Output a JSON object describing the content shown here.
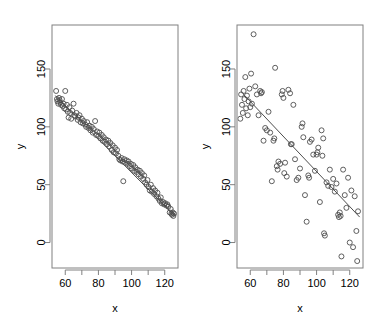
{
  "figure": {
    "type": "scatter-pair",
    "width": 370,
    "height": 332,
    "background": "#ffffff",
    "point_color": "#4d4d4d",
    "line_color": "#4d4d4d",
    "axis_color": "#808080"
  },
  "panels": [
    {
      "id": "left",
      "name": "strong-correlation-panel",
      "xlabel": "x",
      "ylabel": "y",
      "x_ticks": [
        60,
        70,
        80,
        90,
        100,
        110,
        120
      ],
      "x_tick_labels": [
        "60",
        "",
        "80",
        "",
        "100",
        "",
        "120"
      ],
      "y_ticks": [
        0,
        50,
        100,
        150
      ],
      "y_tick_labels": [
        "0",
        "50",
        "100",
        "150"
      ],
      "xlim": [
        52,
        128
      ],
      "ylim": [
        -22,
        188
      ]
    },
    {
      "id": "right",
      "name": "weak-correlation-panel",
      "xlabel": "x",
      "ylabel": "y",
      "x_ticks": [
        60,
        70,
        80,
        90,
        100,
        110,
        120
      ],
      "x_tick_labels": [
        "60",
        "",
        "80",
        "",
        "100",
        "",
        "120"
      ],
      "y_ticks": [
        0,
        50,
        100,
        150
      ],
      "y_tick_labels": [
        "0",
        "50",
        "100",
        "150"
      ],
      "xlim": [
        52,
        128
      ],
      "ylim": [
        -22,
        188
      ]
    }
  ],
  "chart_data": [
    {
      "type": "scatter",
      "title": "",
      "xlabel": "x",
      "ylabel": "y",
      "xlim": [
        52,
        128
      ],
      "ylim": [
        -22,
        188
      ],
      "grid": false,
      "legend": false,
      "marker": "open-circle",
      "regression_line": {
        "x": [
          54,
          126
        ],
        "y": [
          127,
          23
        ]
      },
      "points": [
        [
          54.5,
          131
        ],
        [
          55.0,
          124
        ],
        [
          55.3,
          122
        ],
        [
          55.8,
          120
        ],
        [
          56.2,
          125
        ],
        [
          56.6,
          123
        ],
        [
          57.0,
          121
        ],
        [
          57.5,
          119
        ],
        [
          58.0,
          124
        ],
        [
          58.5,
          118
        ],
        [
          59.0,
          120
        ],
        [
          59.4,
          116
        ],
        [
          60.0,
          131
        ],
        [
          60.5,
          115
        ],
        [
          61.0,
          119
        ],
        [
          61.5,
          113
        ],
        [
          62.0,
          108
        ],
        [
          62.5,
          117
        ],
        [
          63.0,
          112
        ],
        [
          63.6,
          107
        ],
        [
          64.2,
          114
        ],
        [
          65.0,
          120
        ],
        [
          65.5,
          110
        ],
        [
          66.0,
          109
        ],
        [
          66.8,
          112
        ],
        [
          67.5,
          106
        ],
        [
          68.0,
          108
        ],
        [
          68.6,
          110
        ],
        [
          69.2,
          104
        ],
        [
          70.0,
          107
        ],
        [
          70.6,
          103
        ],
        [
          71.2,
          105
        ],
        [
          72.0,
          102
        ],
        [
          72.6,
          100
        ],
        [
          73.2,
          104
        ],
        [
          74.0,
          99
        ],
        [
          74.6,
          101
        ],
        [
          75.2,
          97
        ],
        [
          76.0,
          100
        ],
        [
          76.6,
          95
        ],
        [
          77.2,
          98
        ],
        [
          78.0,
          105
        ],
        [
          78.6,
          93
        ],
        [
          79.2,
          96
        ],
        [
          80.0,
          92
        ],
        [
          80.6,
          95
        ],
        [
          81.2,
          90
        ],
        [
          82.0,
          93
        ],
        [
          82.6,
          88
        ],
        [
          83.2,
          91
        ],
        [
          84.0,
          87
        ],
        [
          84.6,
          89
        ],
        [
          85.2,
          85
        ],
        [
          86.0,
          88
        ],
        [
          86.6,
          83
        ],
        [
          87.2,
          86
        ],
        [
          88.0,
          80
        ],
        [
          88.6,
          84
        ],
        [
          89.2,
          78
        ],
        [
          90.0,
          82
        ],
        [
          90.6,
          77
        ],
        [
          91.2,
          80
        ],
        [
          92.0,
          75
        ],
        [
          92.6,
          72
        ],
        [
          93.2,
          71
        ],
        [
          94.0,
          73
        ],
        [
          94.6,
          70
        ],
        [
          95.0,
          53
        ],
        [
          95.6,
          72
        ],
        [
          96.2,
          69
        ],
        [
          97.0,
          71
        ],
        [
          97.6,
          68
        ],
        [
          98.2,
          70
        ],
        [
          99.0,
          66
        ],
        [
          99.6,
          68
        ],
        [
          100.2,
          64
        ],
        [
          101.0,
          67
        ],
        [
          101.6,
          62
        ],
        [
          102.2,
          65
        ],
        [
          103.0,
          61
        ],
        [
          103.6,
          63
        ],
        [
          104.2,
          59
        ],
        [
          105.0,
          62
        ],
        [
          105.6,
          57
        ],
        [
          106.2,
          60
        ],
        [
          107.0,
          55
        ],
        [
          107.6,
          58
        ],
        [
          108.2,
          52
        ],
        [
          109.0,
          50
        ],
        [
          109.6,
          54
        ],
        [
          110.2,
          48
        ],
        [
          111.0,
          45
        ],
        [
          111.6,
          50
        ],
        [
          112.2,
          44
        ],
        [
          113.0,
          47
        ],
        [
          113.6,
          42
        ],
        [
          114.2,
          45
        ],
        [
          115.0,
          40
        ],
        [
          115.6,
          43
        ],
        [
          116.2,
          38
        ],
        [
          117.0,
          36
        ],
        [
          117.6,
          39
        ],
        [
          118.2,
          34
        ],
        [
          119.0,
          35
        ],
        [
          119.6,
          33
        ],
        [
          120.2,
          34
        ],
        [
          121.0,
          32
        ],
        [
          121.6,
          33
        ],
        [
          122.2,
          31
        ],
        [
          123.0,
          26
        ],
        [
          123.6,
          29
        ],
        [
          124.0,
          25
        ],
        [
          124.4,
          24
        ],
        [
          124.8,
          26
        ],
        [
          125.2,
          23
        ],
        [
          125.6,
          25
        ]
      ]
    },
    {
      "type": "scatter",
      "title": "",
      "xlabel": "x",
      "ylabel": "y",
      "xlim": [
        52,
        128
      ],
      "ylim": [
        -22,
        188
      ],
      "grid": false,
      "legend": false,
      "marker": "open-circle",
      "regression_line": {
        "x": [
          56,
          126
        ],
        "y": [
          128,
          22
        ]
      },
      "points": [
        [
          54.0,
          107
        ],
        [
          54.5,
          128
        ],
        [
          55.0,
          119
        ],
        [
          55.5,
          112
        ],
        [
          56.0,
          131
        ],
        [
          56.5,
          124
        ],
        [
          57.0,
          143
        ],
        [
          57.5,
          116
        ],
        [
          58.0,
          127
        ],
        [
          58.5,
          110
        ],
        [
          59.0,
          122
        ],
        [
          59.5,
          133
        ],
        [
          60.0,
          117
        ],
        [
          60.5,
          146
        ],
        [
          61.0,
          120
        ],
        [
          62.0,
          180
        ],
        [
          63.0,
          135
        ],
        [
          64.0,
          128
        ],
        [
          65.0,
          110
        ],
        [
          66.0,
          131
        ],
        [
          66.5,
          129
        ],
        [
          67.0,
          130
        ],
        [
          68.0,
          88
        ],
        [
          69.0,
          99
        ],
        [
          70.0,
          97
        ],
        [
          71.0,
          113
        ],
        [
          72.0,
          95
        ],
        [
          73.0,
          53
        ],
        [
          74.0,
          88
        ],
        [
          74.5,
          90
        ],
        [
          75.0,
          151
        ],
        [
          76.0,
          66
        ],
        [
          76.5,
          63
        ],
        [
          77.0,
          70
        ],
        [
          78.0,
          68
        ],
        [
          79.0,
          128
        ],
        [
          79.5,
          131
        ],
        [
          80.0,
          125
        ],
        [
          80.5,
          60
        ],
        [
          81.0,
          69
        ],
        [
          82.0,
          57
        ],
        [
          83.0,
          132
        ],
        [
          84.0,
          129
        ],
        [
          84.5,
          85
        ],
        [
          85.0,
          85
        ],
        [
          86.0,
          119
        ],
        [
          87.0,
          72
        ],
        [
          88.0,
          54
        ],
        [
          89.0,
          56
        ],
        [
          90.0,
          64
        ],
        [
          91.0,
          100
        ],
        [
          91.5,
          103
        ],
        [
          92.0,
          91
        ],
        [
          93.0,
          41
        ],
        [
          94.0,
          18
        ],
        [
          95.0,
          58
        ],
        [
          95.5,
          56
        ],
        [
          96.0,
          87
        ],
        [
          97.0,
          89
        ],
        [
          98.0,
          76
        ],
        [
          99.0,
          62
        ],
        [
          100.0,
          76
        ],
        [
          100.5,
          78
        ],
        [
          101.0,
          82
        ],
        [
          102.0,
          35
        ],
        [
          103.0,
          97
        ],
        [
          103.5,
          75
        ],
        [
          104.0,
          90
        ],
        [
          104.5,
          8
        ],
        [
          105.0,
          6
        ],
        [
          106.0,
          52
        ],
        [
          107.0,
          49
        ],
        [
          108.0,
          63
        ],
        [
          109.0,
          48
        ],
        [
          110.0,
          55
        ],
        [
          111.0,
          44
        ],
        [
          112.0,
          51
        ],
        [
          113.0,
          24
        ],
        [
          113.5,
          22
        ],
        [
          114.0,
          26
        ],
        [
          114.5,
          23
        ],
        [
          115.0,
          -12
        ],
        [
          116.0,
          63
        ],
        [
          117.0,
          41
        ],
        [
          118.0,
          30
        ],
        [
          119.0,
          56
        ],
        [
          120.0,
          0
        ],
        [
          121.0,
          45
        ],
        [
          122.0,
          -4
        ],
        [
          123.0,
          40
        ],
        [
          124.0,
          10
        ],
        [
          124.5,
          -16
        ],
        [
          125.0,
          27
        ]
      ]
    }
  ]
}
